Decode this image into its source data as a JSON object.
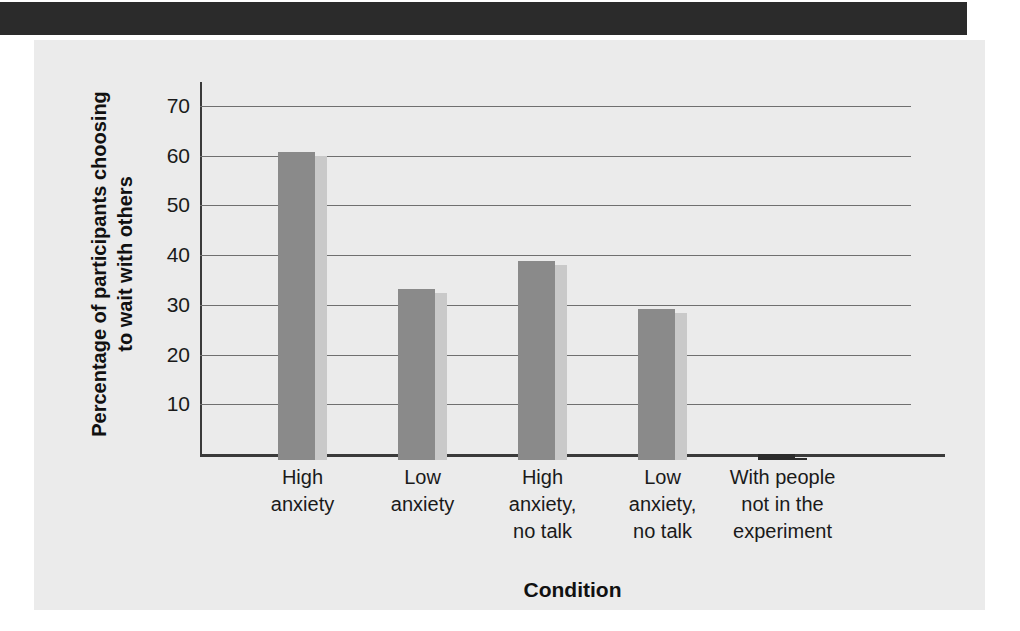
{
  "figure": {
    "header_band_color": "#2b2b2b",
    "panel_background": "#ebebeb"
  },
  "chart_data": {
    "type": "bar",
    "title": "",
    "subtitle": "",
    "xlabel": "Condition",
    "ylabel": "Percentage of participants choosing\nto wait with others",
    "categories": [
      "High\nanxiety",
      "Low\nanxiety",
      "High\nanxiety,\nno talk",
      "Low\nanxiety,\nno talk",
      "With people\nnot in the\nexperiment"
    ],
    "values": [
      62,
      34.5,
      40,
      30.3,
      1.2
    ],
    "bar_colors": [
      "#8a8a8a",
      "#8a8a8a",
      "#8a8a8a",
      "#8a8a8a",
      "#2b2b2b"
    ],
    "bar_shadow_colors": [
      "#c9c9c9",
      "#c9c9c9",
      "#c9c9c9",
      "#c9c9c9",
      "#2b2b2b"
    ],
    "ylim": [
      0,
      73
    ],
    "yticks": [
      10,
      20,
      30,
      40,
      50,
      60,
      70
    ],
    "ytick_labels": [
      "10",
      "20",
      "30",
      "40",
      "50",
      "60",
      "70"
    ],
    "grid": true,
    "grid_color": "#6f6f6f",
    "legend": null,
    "annotations": []
  }
}
